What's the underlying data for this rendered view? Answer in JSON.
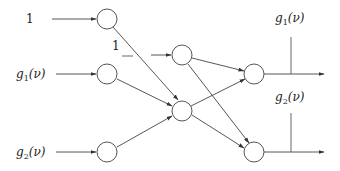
{
  "diagram": {
    "title": "",
    "type": "neural-network",
    "colors": {
      "stroke": "#444444",
      "node_fill": "#ffffff",
      "text": "#222222"
    },
    "inputs": [
      {
        "id": "in_bias",
        "label": "1",
        "label_main": "1",
        "label_sub": "",
        "label_arg": ""
      },
      {
        "id": "in_g1",
        "label": "g1(ν)",
        "label_main": "g",
        "label_sub": "1",
        "label_arg": "(ν)"
      },
      {
        "id": "in_g2",
        "label": "g2(ν)",
        "label_main": "g",
        "label_sub": "2",
        "label_arg": "(ν)"
      }
    ],
    "hidden_bias": {
      "id": "bias2",
      "label": "1",
      "dash": "_"
    },
    "outputs": [
      {
        "id": "out_g1",
        "label": "g1(ν)",
        "label_main": "g",
        "label_sub": "1",
        "label_arg": "(ν)"
      },
      {
        "id": "out_g2",
        "label": "g2(ν)",
        "label_main": "g",
        "label_sub": "2",
        "label_arg": "(ν)"
      }
    ],
    "nodes": [
      {
        "id": "n1",
        "layer": 1,
        "cx": 107,
        "cy": 19
      },
      {
        "id": "n2",
        "layer": 1,
        "cx": 107,
        "cy": 74
      },
      {
        "id": "n3",
        "layer": 1,
        "cx": 107,
        "cy": 152
      },
      {
        "id": "b2",
        "layer": 2,
        "cx": 182,
        "cy": 55
      },
      {
        "id": "h1",
        "layer": 2,
        "cx": 182,
        "cy": 111
      },
      {
        "id": "o1",
        "layer": 3,
        "cx": 254,
        "cy": 74
      },
      {
        "id": "o2",
        "layer": 3,
        "cx": 254,
        "cy": 152
      }
    ],
    "edges": [
      [
        "n1",
        "h1"
      ],
      [
        "n2",
        "h1"
      ],
      [
        "n3",
        "h1"
      ],
      [
        "b2",
        "o1"
      ],
      [
        "b2",
        "o2"
      ],
      [
        "h1",
        "o1"
      ],
      [
        "h1",
        "o2"
      ]
    ]
  }
}
